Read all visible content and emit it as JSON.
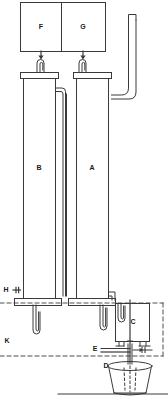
{
  "diagram": {
    "type": "apparatus-schematic",
    "title": "",
    "background_color": "#ffffff",
    "line_color": "#3a3a3a",
    "label_color": "#1a1a1a"
  },
  "labels": {
    "reservoir_left": "F",
    "reservoir_right": "G",
    "column_left": "B",
    "column_right": "A",
    "valve_left": "H",
    "enclosure": "K",
    "collector_box": "C",
    "valve_outlet": "E",
    "funnel": "D"
  },
  "components": [
    {
      "id": "F",
      "name": "left-reservoir",
      "shape": "rectangle",
      "label": "F"
    },
    {
      "id": "G",
      "name": "right-reservoir",
      "shape": "rectangle",
      "label": "G"
    },
    {
      "id": "B",
      "name": "left-column",
      "shape": "tall-rectangle",
      "label": "B"
    },
    {
      "id": "A",
      "name": "right-column",
      "shape": "tall-rectangle",
      "label": "A"
    },
    {
      "id": "H",
      "name": "left-valve",
      "shape": "valve",
      "label": "H"
    },
    {
      "id": "K",
      "name": "dashed-enclosure",
      "shape": "dashed-boundary",
      "label": "K"
    },
    {
      "id": "C",
      "name": "collector-box",
      "shape": "rectangle",
      "label": "C"
    },
    {
      "id": "E",
      "name": "outlet-valve",
      "shape": "valve",
      "label": "E"
    },
    {
      "id": "D",
      "name": "funnel-vessel",
      "shape": "trapezoid",
      "label": "D"
    }
  ]
}
